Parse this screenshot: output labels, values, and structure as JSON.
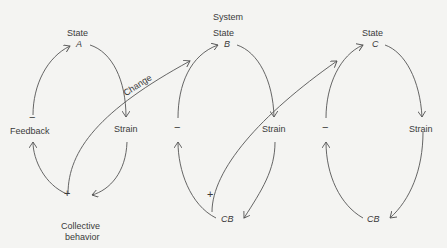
{
  "diagram": {
    "title": "System",
    "systems": [
      {
        "state_label": "State",
        "state_id": "A",
        "strain_label": "Strain",
        "behavior_label": "Collective behavior",
        "behavior_line1": "Collective",
        "behavior_line2": "behavior",
        "feedback_label": "Feedback",
        "feedback_sign": "−",
        "change_sign": "+"
      },
      {
        "state_label": "State",
        "state_id": "B",
        "strain_label": "Strain",
        "behavior_label": "CB",
        "feedback_sign": "−",
        "change_sign": "+"
      },
      {
        "state_label": "State",
        "state_id": "C",
        "strain_label": "Strain",
        "behavior_label": "CB",
        "feedback_sign": "−"
      }
    ],
    "change_label": "Change"
  }
}
